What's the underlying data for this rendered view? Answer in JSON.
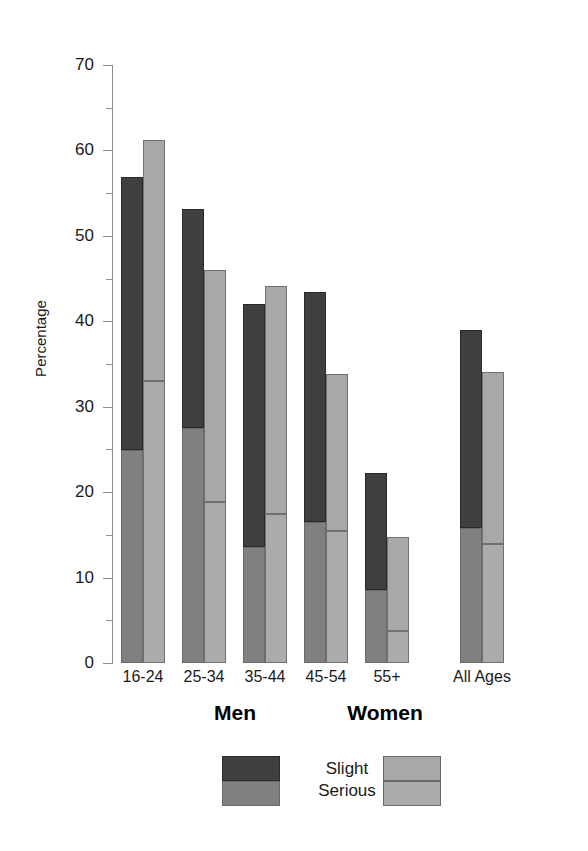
{
  "chart_data": {
    "type": "bar",
    "subtype": "grouped-stacked",
    "title": "",
    "xlabel": "",
    "ylabel": "Percentage",
    "ylim": [
      0,
      70
    ],
    "ytick_values": [
      0,
      10,
      20,
      30,
      40,
      50,
      60,
      70
    ],
    "ytick_labels": [
      "0",
      "10",
      "20",
      "30",
      "40",
      "50",
      "60",
      "70"
    ],
    "yminor_step": 5,
    "grid": false,
    "legend_position": "bottom",
    "categories": [
      "16-24",
      "25-34",
      "35-44",
      "45-54",
      "55+",
      "All Ages"
    ],
    "group_names": [
      "Men",
      "Women"
    ],
    "stack_names": [
      "Slight",
      "Serious"
    ],
    "series": [
      {
        "group": "Men",
        "stack": "Serious",
        "values": [
          24.9,
          27.5,
          13.6,
          16.5,
          8.6,
          15.8
        ]
      },
      {
        "group": "Men",
        "stack": "Slight",
        "values": [
          32.0,
          25.7,
          28.4,
          26.9,
          13.6,
          23.2
        ]
      },
      {
        "group": "Women",
        "stack": "Serious",
        "values": [
          33.0,
          18.8,
          17.4,
          15.5,
          3.8,
          13.9
        ]
      },
      {
        "group": "Women",
        "stack": "Slight",
        "values": [
          28.2,
          27.2,
          26.7,
          18.3,
          10.9,
          20.2
        ]
      }
    ],
    "totals": {
      "Men": [
        56.9,
        53.2,
        42.0,
        43.4,
        22.2,
        39.0
      ],
      "Women": [
        61.2,
        46.0,
        44.1,
        33.8,
        14.7,
        34.1
      ]
    },
    "annotations": []
  },
  "axis": {
    "y_title": "Percentage"
  },
  "legend": {
    "men_label": "Men",
    "women_label": "Women",
    "slight_label": "Slight",
    "serious_label": "Serious"
  },
  "colors": {
    "men_slight": "#3f3f3f",
    "men_serious": "#808080",
    "women_slight": "#a8a8a8",
    "women_serious": "#ababab",
    "axis": "#8d8d8d",
    "text": "#1a1a1a",
    "background": "#ffffff"
  }
}
